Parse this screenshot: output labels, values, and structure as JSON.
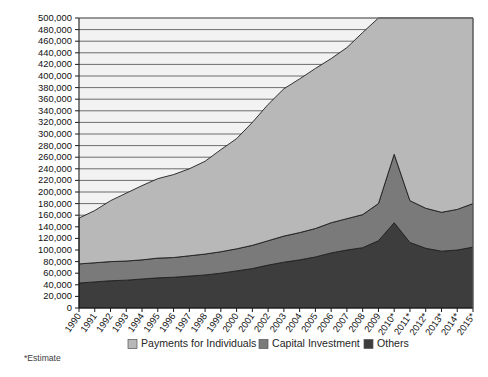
{
  "chart_data": {
    "type": "area",
    "stacked": true,
    "title": "",
    "subtitle": "",
    "xlabel": "",
    "ylabel": "",
    "ylim": [
      0,
      500000
    ],
    "grid": true,
    "grid_axis": "y",
    "legend_position": "bottom",
    "footnote": "*Estimate",
    "x": [
      "1990",
      "1991",
      "1992",
      "1993",
      "1994",
      "1995",
      "1996",
      "1997",
      "1998",
      "1999",
      "2000",
      "2001",
      "2002",
      "2003",
      "2004",
      "2005",
      "2006",
      "2007",
      "2008",
      "2009",
      "2010*",
      "2011*",
      "2012*",
      "2013*",
      "2014*",
      "2015*"
    ],
    "categories": [
      "1990",
      "1991",
      "1992",
      "1993",
      "1994",
      "1995",
      "1996",
      "1997",
      "1998",
      "1999",
      "2000",
      "2001",
      "2002",
      "2003",
      "2004",
      "2005",
      "2006",
      "2007",
      "2008",
      "2009",
      "2010*",
      "2011*",
      "2012*",
      "2013*",
      "2014*",
      "2015*"
    ],
    "ytick_labels": [
      "0",
      "20,000",
      "40,000",
      "60,000",
      "80,000",
      "100,000",
      "120,000",
      "140,000",
      "160,000",
      "180,000",
      "200,000",
      "220,000",
      "240,000",
      "260,000",
      "280,000",
      "300,000",
      "320,000",
      "340,000",
      "360,000",
      "380,000",
      "400,000",
      "420,000",
      "440,000",
      "460,000",
      "480,000",
      "500,000"
    ],
    "ytick_values": [
      0,
      20000,
      40000,
      60000,
      80000,
      100000,
      120000,
      140000,
      160000,
      180000,
      200000,
      220000,
      240000,
      260000,
      280000,
      300000,
      320000,
      340000,
      360000,
      380000,
      400000,
      420000,
      440000,
      460000,
      480000,
      500000
    ],
    "series": [
      {
        "name": "Others",
        "color": "#3d3d3d",
        "stack_order": 1,
        "values": [
          43000,
          45000,
          47000,
          48000,
          50000,
          52000,
          53000,
          55000,
          57000,
          60000,
          64000,
          68000,
          74000,
          79000,
          83000,
          88000,
          95000,
          100000,
          104000,
          116000,
          147000,
          113000,
          103000,
          98000,
          100000,
          105000
        ]
      },
      {
        "name": "Capital Investment",
        "color": "#7a7a7a",
        "stack_order": 2,
        "values": [
          33000,
          33000,
          33000,
          33000,
          33000,
          34000,
          34000,
          35000,
          36000,
          37000,
          38000,
          40000,
          42000,
          45000,
          47000,
          49000,
          52000,
          54000,
          57000,
          64000,
          118000,
          72000,
          69000,
          67000,
          70000,
          75000
        ]
      },
      {
        "name": "Payments for Individuals",
        "color": "#b8b8b8",
        "stack_order": 3,
        "values": [
          79000,
          90000,
          105000,
          117000,
          128000,
          137000,
          143000,
          150000,
          160000,
          176000,
          190000,
          212000,
          235000,
          254000,
          265000,
          276000,
          283000,
          295000,
          314000,
          340000,
          235000,
          315000,
          328000,
          335000,
          330000,
          320000
        ]
      }
    ],
    "stack_totals": [
      155000,
      168000,
      185000,
      198000,
      211000,
      223000,
      230000,
      240000,
      253000,
      273000,
      292000,
      320000,
      351000,
      378000,
      395000,
      413000,
      430000,
      449000,
      475000,
      520000,
      500000,
      500000,
      500000,
      500000,
      500000,
      500000
    ]
  },
  "legend": {
    "items": [
      {
        "label": "Payments for Individuals",
        "color": "#b8b8b8"
      },
      {
        "label": "Capital Investment",
        "color": "#7a7a7a"
      },
      {
        "label": "Others",
        "color": "#3d3d3d"
      }
    ]
  },
  "footnote": {
    "text": "*Estimate"
  },
  "colors": {
    "payments_for_individuals": "#b8b8b8",
    "capital_investment": "#7a7a7a",
    "others": "#3d3d3d",
    "gridline": "#4a4a4a",
    "axis": "#1a1a1a",
    "background": "#ffffff"
  }
}
